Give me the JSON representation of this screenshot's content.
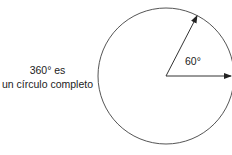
{
  "caption": {
    "line1": "360° es",
    "line2": "un círculo completo"
  },
  "angle_label": "60°",
  "diagram": {
    "shape": "circle",
    "angle_degrees": 60,
    "stroke_color": "#555555"
  }
}
